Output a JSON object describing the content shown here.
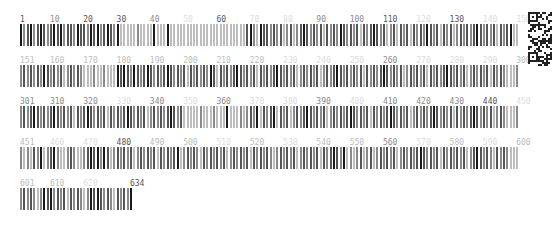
{
  "layout": {
    "per_row": 150,
    "bar_pitch": 3.33,
    "row_tops": [
      15,
      56,
      97,
      138,
      179
    ]
  },
  "colors": {
    "dark": "#1a1a1a",
    "mid": "#555555",
    "gray": "#8a8a8a",
    "light": "#bdbdbd",
    "faint": "#dcdcdc"
  },
  "rows": [
    {
      "start": 1,
      "end": 150,
      "labels": [
        {
          "text": "1",
          "pos": 1,
          "shade": "mid"
        },
        {
          "text": "10",
          "pos": 10,
          "shade": "gray"
        },
        {
          "text": "20",
          "pos": 20,
          "shade": "mid"
        },
        {
          "text": "30",
          "pos": 30,
          "shade": "mid"
        },
        {
          "text": "40",
          "pos": 40,
          "shade": "gray"
        },
        {
          "text": "50",
          "pos": 50,
          "shade": "faint"
        },
        {
          "text": "60",
          "pos": 60,
          "shade": "mid"
        },
        {
          "text": "70",
          "pos": 70,
          "shade": "faint"
        },
        {
          "text": "80",
          "pos": 80,
          "shade": "faint"
        },
        {
          "text": "90",
          "pos": 90,
          "shade": "gray"
        },
        {
          "text": "100",
          "pos": 100,
          "shade": "gray"
        },
        {
          "text": "110",
          "pos": 110,
          "shade": "mid"
        },
        {
          "text": "120",
          "pos": 120,
          "shade": "faint"
        },
        {
          "text": "130",
          "pos": 130,
          "shade": "mid"
        },
        {
          "text": "140",
          "pos": 140,
          "shade": "faint"
        },
        {
          "text": "150",
          "pos": 150,
          "shade": "faint"
        }
      ],
      "bars": "dgmdgmdmgmdmdgmmgdmmgdmdgmdmgdlllllglllldllldlllllllllllllllllllllllmdgldmmgmgmlgmlgmdmgmgmlmgmgdmgmgmlmgmdmgmlgmlmgmlmgmgdmgmlmgmlgmgmgmdmgmgmlmgmdlll"
    },
    {
      "start": 151,
      "end": 300,
      "labels": [
        {
          "text": "151",
          "pos": 151,
          "shade": "light"
        },
        {
          "text": "160",
          "pos": 160,
          "shade": "light"
        },
        {
          "text": "170",
          "pos": 170,
          "shade": "light"
        },
        {
          "text": "180",
          "pos": 180,
          "shade": "light"
        },
        {
          "text": "190",
          "pos": 190,
          "shade": "light"
        },
        {
          "text": "200",
          "pos": 200,
          "shade": "light"
        },
        {
          "text": "210",
          "pos": 210,
          "shade": "light"
        },
        {
          "text": "220",
          "pos": 220,
          "shade": "light"
        },
        {
          "text": "230",
          "pos": 230,
          "shade": "faint"
        },
        {
          "text": "240",
          "pos": 240,
          "shade": "faint"
        },
        {
          "text": "250",
          "pos": 250,
          "shade": "faint"
        },
        {
          "text": "260",
          "pos": 260,
          "shade": "gray"
        },
        {
          "text": "270",
          "pos": 270,
          "shade": "faint"
        },
        {
          "text": "280",
          "pos": 280,
          "shade": "faint"
        },
        {
          "text": "290",
          "pos": 290,
          "shade": "faint"
        },
        {
          "text": "300",
          "pos": 300,
          "shade": "light"
        }
      ],
      "bars": "gmgmgmgdmgmgmlgmgmglllgllgllldmdmgdmgmdmgmgmdmgmgmlmgmgmgdmlmgmgmdmgmgmlmgmgmdmgmgmlgmgmgmlgmgmdmgmgmgmlmgmgmdmgmgmlgmgmgmlmgmgmdmgmgmlgmgmgmlmgmglll"
    },
    {
      "start": 301,
      "end": 450,
      "labels": [
        {
          "text": "301",
          "pos": 301,
          "shade": "gray"
        },
        {
          "text": "310",
          "pos": 310,
          "shade": "gray"
        },
        {
          "text": "320",
          "pos": 320,
          "shade": "gray"
        },
        {
          "text": "330",
          "pos": 330,
          "shade": "faint"
        },
        {
          "text": "340",
          "pos": 340,
          "shade": "gray"
        },
        {
          "text": "350",
          "pos": 350,
          "shade": "faint"
        },
        {
          "text": "360",
          "pos": 360,
          "shade": "gray"
        },
        {
          "text": "370",
          "pos": 370,
          "shade": "faint"
        },
        {
          "text": "380",
          "pos": 380,
          "shade": "faint"
        },
        {
          "text": "390",
          "pos": 390,
          "shade": "gray"
        },
        {
          "text": "400",
          "pos": 400,
          "shade": "faint"
        },
        {
          "text": "410",
          "pos": 410,
          "shade": "gray"
        },
        {
          "text": "420",
          "pos": 420,
          "shade": "gray"
        },
        {
          "text": "430",
          "pos": 430,
          "shade": "gray"
        },
        {
          "text": "440",
          "pos": 440,
          "shade": "mid"
        },
        {
          "text": "450",
          "pos": 450,
          "shade": "faint"
        }
      ],
      "bars": "gmgmdmgmgmdmgmgmlmgmdmgmgmlmgmgmdmgmgmlgmgmgmdmgmlllllglllgllldlllglgmgdlmgmdlmgmlgmgmdmgmgmlgmgmgmdmgmgmlmgmgmdmgmgmlgmgmgmdmgmgmlmgmgmdmgmgmlgmglll"
    },
    {
      "start": 451,
      "end": 600,
      "labels": [
        {
          "text": "451",
          "pos": 451,
          "shade": "light"
        },
        {
          "text": "460",
          "pos": 460,
          "shade": "faint"
        },
        {
          "text": "470",
          "pos": 470,
          "shade": "faint"
        },
        {
          "text": "480",
          "pos": 480,
          "shade": "mid"
        },
        {
          "text": "490",
          "pos": 490,
          "shade": "light"
        },
        {
          "text": "500",
          "pos": 500,
          "shade": "light"
        },
        {
          "text": "510",
          "pos": 510,
          "shade": "faint"
        },
        {
          "text": "520",
          "pos": 520,
          "shade": "light"
        },
        {
          "text": "530",
          "pos": 530,
          "shade": "faint"
        },
        {
          "text": "540",
          "pos": 540,
          "shade": "light"
        },
        {
          "text": "550",
          "pos": 550,
          "shade": "light"
        },
        {
          "text": "560",
          "pos": 560,
          "shade": "gray"
        },
        {
          "text": "570",
          "pos": 570,
          "shade": "faint"
        },
        {
          "text": "580",
          "pos": 580,
          "shade": "light"
        },
        {
          "text": "590",
          "pos": 590,
          "shade": "faint"
        },
        {
          "text": "600",
          "pos": 600,
          "shade": "light"
        }
      ],
      "bars": "glglmgdlgmdgllgmgllgmdmdgdmlgmgmgmlgmgmgmlmgmgmdlgmgmglmgmgmgmlgmgmgmlmgmgmglgmgmgmlgmgmgmlmgmdmgdlglgmlgmlgmgmgmlgmgmgmdmgmgmlmgmgmgmlgmdmgmglmgmglll"
    },
    {
      "start": 601,
      "end": 634,
      "labels": [
        {
          "text": "601",
          "pos": 601,
          "shade": "light"
        },
        {
          "text": "610",
          "pos": 610,
          "shade": "light"
        },
        {
          "text": "620",
          "pos": 620,
          "shade": "faint"
        },
        {
          "text": "634",
          "pos": 634,
          "shade": "mid"
        }
      ],
      "bars": "gmgmglgdmdgmgmlmgmglgdmdmgmglmgmgd"
    }
  ],
  "qr_code": {
    "label": "qr-code"
  }
}
